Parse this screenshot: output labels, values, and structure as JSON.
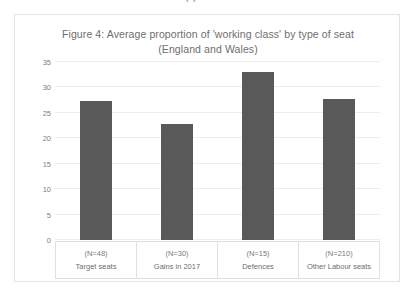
{
  "page": {
    "top_remnant": "▪ ▪"
  },
  "chart_data": {
    "type": "bar",
    "title": "Figure 4: Average proportion of 'working class' by type of seat (England and Wales)",
    "title_line1": "Figure 4: Average proportion of 'working class' by type of seat",
    "title_line2": "(England and Wales)",
    "xlabel": "",
    "ylabel": "",
    "ylim": [
      0,
      35
    ],
    "yticks": [
      0,
      5,
      10,
      15,
      20,
      25,
      30,
      35
    ],
    "ytick_labels": [
      "0",
      "5",
      "10",
      "15",
      "20",
      "25",
      "30",
      "35"
    ],
    "grid": true,
    "legend": false,
    "bar_color": "#595959",
    "categories": [
      "Target seats",
      "Gains in 2017",
      "Defences",
      "Other Labour seats"
    ],
    "counts": [
      "(N=48)",
      "(N=30)",
      "(N=15)",
      "(N=210)"
    ],
    "values": [
      27.4,
      22.8,
      33.0,
      27.8
    ]
  }
}
